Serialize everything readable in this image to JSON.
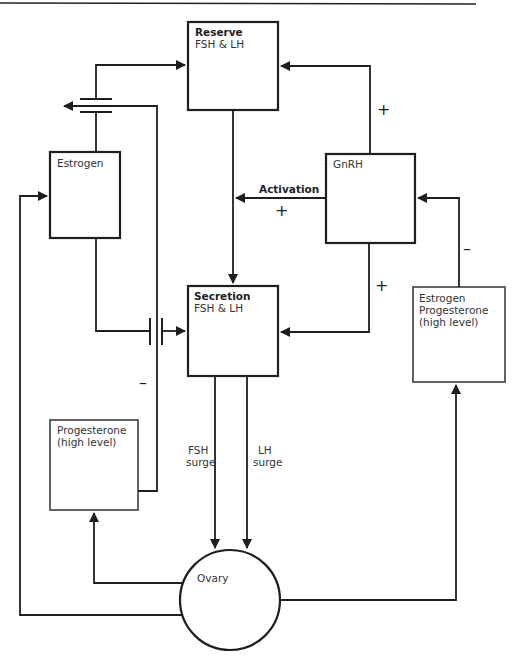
{
  "diagram": {
    "nodes": {
      "reserve": {
        "title": "Reserve",
        "subtitle": "FSH & LH"
      },
      "estrogen": {
        "label": "Estrogen"
      },
      "gnrh": {
        "label": "GnRH"
      },
      "secretion": {
        "title": "Secretion",
        "subtitle": "FSH & LH"
      },
      "estrogen_progesterone": {
        "line1": "Estrogen",
        "line2": "Progesterone",
        "line3": "(high level)"
      },
      "progesterone": {
        "line1": "Progesterone",
        "line2": "(high level)"
      },
      "ovary": {
        "label": "Ovary"
      }
    },
    "edge_labels": {
      "activation": "Activation",
      "activation_sign": "+",
      "gnrh_to_reserve_sign": "+",
      "gnrh_to_secretion_sign": "+",
      "feedback_to_gnrh_sign": "–",
      "progesterone_inhibit_sign": "–",
      "fsh_surge_1": "FSH",
      "fsh_surge_2": "surge",
      "lh_surge_1": "LH",
      "lh_surge_2": "surge"
    },
    "colors": {
      "line": "#1e1e1e",
      "gray_box": "#555555",
      "text": "#333333"
    }
  }
}
